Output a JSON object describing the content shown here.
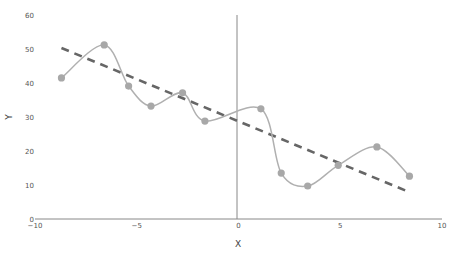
{
  "chart_data": {
    "type": "scatter",
    "title": "",
    "xlabel": "X",
    "ylabel": "Y",
    "xlim": [
      -10,
      10
    ],
    "ylim": [
      0,
      60
    ],
    "x_ticks": [
      -10,
      -5,
      0,
      5,
      10
    ],
    "x_tick_labels": [
      "−10",
      "−5",
      "0",
      "5",
      "10"
    ],
    "y_ticks": [
      0,
      10,
      20,
      30,
      40,
      50,
      60
    ],
    "y_tick_labels": [
      "0",
      "10",
      "20",
      "30",
      "40",
      "50",
      "60"
    ],
    "grid": false,
    "legend": null,
    "series": [
      {
        "name": "data",
        "style": "markers+spline",
        "color": "#a8a8a8",
        "x": [
          -8.7,
          -6.6,
          -5.4,
          -4.3,
          -2.75,
          -1.65,
          1.1,
          2.1,
          3.4,
          4.9,
          6.8,
          8.4
        ],
        "y": [
          41.5,
          51.2,
          39.1,
          33.2,
          37.1,
          28.8,
          32.4,
          13.5,
          9.7,
          15.8,
          21.2,
          12.6
        ]
      },
      {
        "name": "trend",
        "style": "dashed-line",
        "color": "#666666",
        "x": [
          -8.7,
          8.4
        ],
        "y": [
          50.3,
          7.9
        ]
      }
    ]
  },
  "axes": {
    "x_title": "X",
    "y_title": "Y"
  }
}
